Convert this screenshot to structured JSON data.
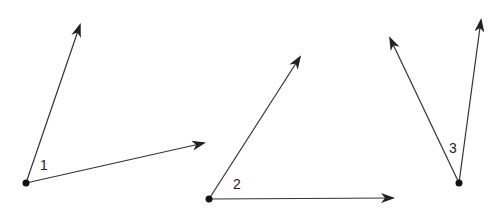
{
  "diagram": {
    "stroke_color": "#222222",
    "angles": [
      {
        "label": "1",
        "vertex": [
          26,
          183
        ],
        "ray_a_end": [
          80,
          25
        ],
        "ray_b_end": [
          204,
          143
        ],
        "label_pos": [
          40,
          170
        ]
      },
      {
        "label": "2",
        "vertex": [
          209,
          199
        ],
        "ray_a_end": [
          300,
          57
        ],
        "ray_b_end": [
          393,
          198
        ],
        "label_pos": [
          233,
          189
        ]
      },
      {
        "label": "3",
        "vertex": [
          459,
          183
        ],
        "ray_a_end": [
          390,
          38
        ],
        "ray_b_end": [
          481,
          20
        ],
        "label_pos": [
          449,
          153
        ]
      }
    ]
  }
}
